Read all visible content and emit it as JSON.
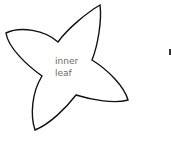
{
  "diagram": {
    "shape": "four-pointed-leaf",
    "stroke_color": "#111111",
    "fill_color": "#ffffff",
    "label_line1": "inner",
    "label_line2": "leaf"
  }
}
